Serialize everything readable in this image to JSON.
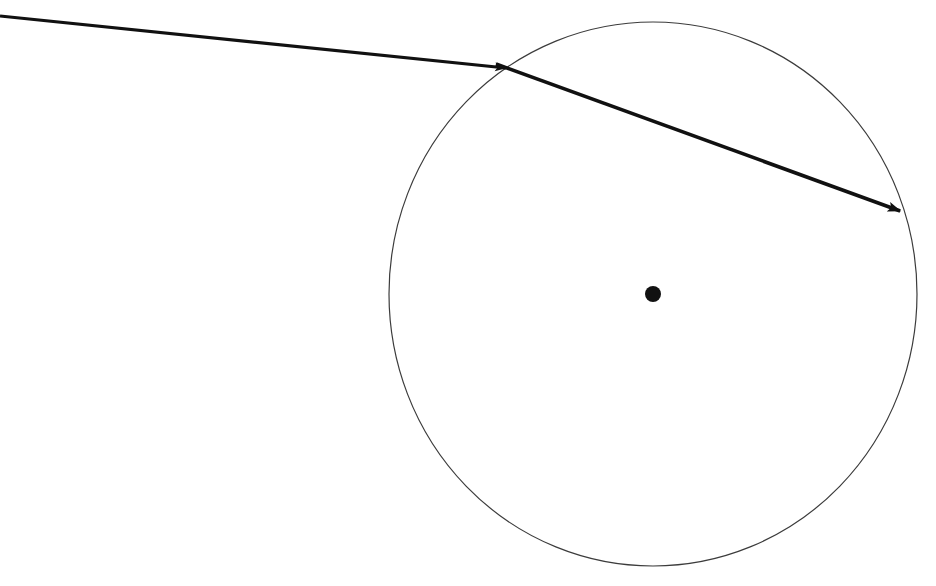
{
  "figure": {
    "background_color": "#ffffff",
    "width": 936,
    "height": 586,
    "elements": {
      "circle": {
        "name": "circle-outline",
        "center_x": 653,
        "center_y": 294,
        "radius_x": 264,
        "radius_y": 272,
        "stroke_color": "#3c3c3c",
        "stroke_width": 1.2,
        "fill": "none"
      },
      "center_dot": {
        "name": "center-point-dot",
        "center_x": 653,
        "center_y": 294,
        "radius": 8,
        "fill_color": "#111111"
      },
      "incoming_ray": {
        "name": "incoming-ray-arrow",
        "start_x": 0,
        "start_y": 16,
        "end_x": 506,
        "end_y": 68,
        "stroke_color": "#111111",
        "stroke_width": 3.2,
        "arrowhead": "solid-triangle"
      },
      "chord_ray": {
        "name": "chord-ray-arrow",
        "start_x": 496,
        "start_y": 64,
        "end_x": 903,
        "end_y": 212,
        "stroke_color": "#111111",
        "stroke_width": 3.6,
        "arrowhead": "solid-triangle"
      }
    }
  },
  "chart_data": {
    "type": "diagram",
    "title": "",
    "xlabel": "",
    "ylabel": "",
    "points": [
      {
        "label": "ray-origin",
        "x": 0,
        "y": 16
      },
      {
        "label": "entry-point",
        "x": 503,
        "y": 67
      },
      {
        "label": "exit-point",
        "x": 903,
        "y": 212
      },
      {
        "label": "circle-center",
        "x": 653,
        "y": 294
      },
      {
        "label": "circle-top",
        "x": 677,
        "y": 22
      },
      {
        "label": "circle-bottom",
        "x": 657,
        "y": 565
      },
      {
        "label": "circle-left",
        "x": 389,
        "y": 300
      },
      {
        "label": "circle-right",
        "x": 916,
        "y": 300
      }
    ]
  }
}
